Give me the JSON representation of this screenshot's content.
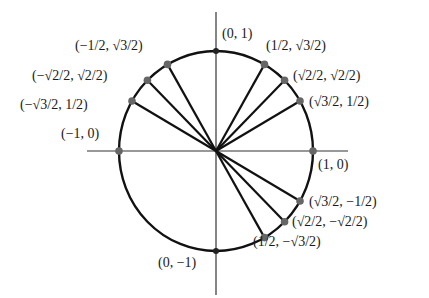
{
  "diagram": {
    "center": [
      216,
      151
    ],
    "radius_x": 97,
    "radius_y": 100,
    "axis": {
      "x_start": 87,
      "x_end": 348,
      "y_start": 12,
      "y_end": 295
    },
    "colors": {
      "stroke": "#111111",
      "axis": "#333333",
      "point": "#666666",
      "text": "#1a1a1a"
    },
    "points": [
      {
        "id": "p0",
        "angle": 0,
        "label": "(1, 0)",
        "spoke": false,
        "lx": 318,
        "ly": 158
      },
      {
        "id": "p30",
        "angle": 30,
        "label": "(√3/2, 1/2)",
        "spoke": true,
        "lx": 309,
        "ly": 95
      },
      {
        "id": "p45",
        "angle": 45,
        "label": "(√2/2, √2/2)",
        "spoke": true,
        "lx": 293,
        "ly": 69
      },
      {
        "id": "p60",
        "angle": 60,
        "label": "(1/2, √3/2)",
        "spoke": true,
        "lx": 266,
        "ly": 39
      },
      {
        "id": "p90",
        "angle": 90,
        "label": "(0, 1)",
        "spoke": false,
        "lx": 222,
        "ly": 27
      },
      {
        "id": "p120",
        "angle": 120,
        "label": "(−1/2, √3/2)",
        "spoke": true,
        "lx": 75,
        "ly": 39
      },
      {
        "id": "p135",
        "angle": 135,
        "label": "(−√2/2, √2/2)",
        "spoke": true,
        "lx": 32,
        "ly": 69
      },
      {
        "id": "p150",
        "angle": 150,
        "label": "(−√3/2, 1/2)",
        "spoke": true,
        "lx": 20,
        "ly": 98
      },
      {
        "id": "p180",
        "angle": 180,
        "label": "(−1, 0)",
        "spoke": false,
        "lx": 61,
        "ly": 127
      },
      {
        "id": "p270",
        "angle": 270,
        "label": "(0, −1)",
        "spoke": false,
        "lx": 158,
        "ly": 256
      },
      {
        "id": "p300",
        "angle": 300,
        "label": "(1/2, −√3/2)",
        "spoke": true,
        "lx": 253,
        "ly": 235
      },
      {
        "id": "p315",
        "angle": 315,
        "label": "(√2/2, −√2/2)",
        "spoke": true,
        "lx": 292,
        "ly": 215
      },
      {
        "id": "p330",
        "angle": 330,
        "label": "(√3/2, −1/2)",
        "spoke": true,
        "lx": 309,
        "ly": 195
      }
    ]
  }
}
